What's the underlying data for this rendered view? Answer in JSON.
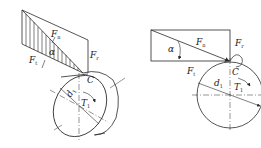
{
  "figures": [
    {
      "id": "left",
      "description": "3D force decomposition on a spur gear tooth",
      "labels": {
        "Fn": {
          "main": "F",
          "sub": "n"
        },
        "Fr": {
          "main": "F",
          "sub": "r"
        },
        "Ft": {
          "main": "F",
          "sub": "t"
        },
        "alpha": "α",
        "C": "C",
        "d1": {
          "main": "d",
          "sub": "1"
        },
        "T1": {
          "main": "T",
          "sub": "1"
        }
      }
    },
    {
      "id": "right",
      "description": "2D force decomposition at pitch point C",
      "labels": {
        "Fn": {
          "main": "F",
          "sub": "n"
        },
        "Fr": {
          "main": "F",
          "sub": "r"
        },
        "Ft": {
          "main": "F",
          "sub": "t"
        },
        "alpha": "α",
        "C": "C",
        "d1": {
          "main": "d",
          "sub": "1"
        },
        "T1": {
          "main": "T",
          "sub": "1"
        }
      }
    }
  ],
  "colors": {
    "line": "#2a2a2a",
    "background": "#ffffff"
  }
}
